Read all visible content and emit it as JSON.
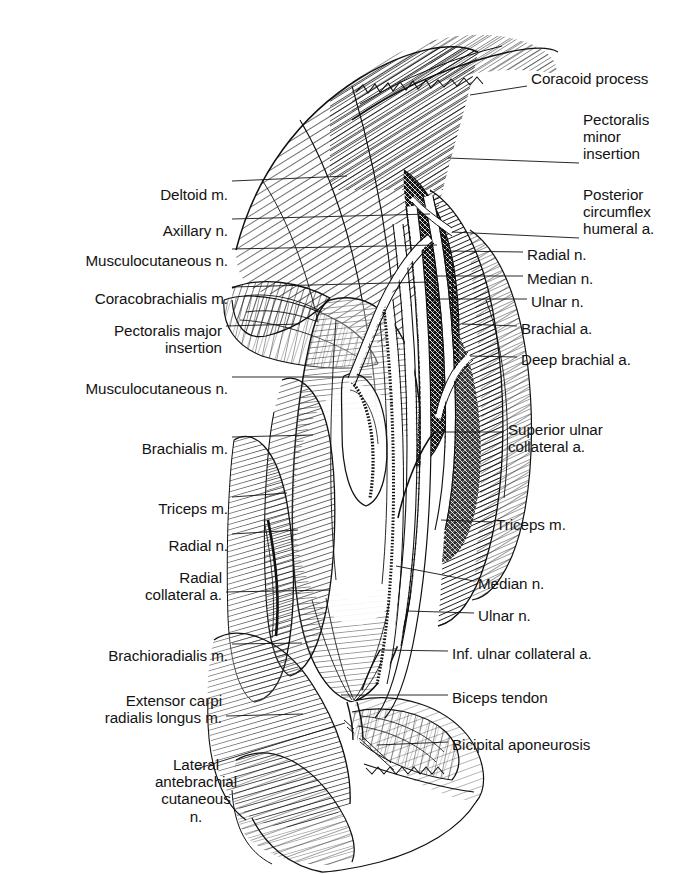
{
  "page": {
    "running_head": "THE ARM",
    "page_number": "123",
    "figure_title": "Anterior dissection of the right arm",
    "background_color": "#ffffff",
    "ink_color": "#111111",
    "style": "pen-and-ink line engraving"
  },
  "labels_left": [
    {
      "id": "deltoid",
      "text": "Deltoid m.",
      "x": 228,
      "y": 186,
      "align": "right",
      "leader": {
        "x1": 232,
        "y1": 181,
        "x2": 347,
        "y2": 176
      }
    },
    {
      "id": "axillary-n",
      "text": "Axillary n.",
      "x": 228,
      "y": 222,
      "align": "right",
      "leader": {
        "x1": 232,
        "y1": 219,
        "x2": 430,
        "y2": 214
      }
    },
    {
      "id": "musculocutaneous-1",
      "text": "Musculocutaneous n.",
      "x": 228,
      "y": 252,
      "align": "right",
      "leader": {
        "x1": 232,
        "y1": 249,
        "x2": 437,
        "y2": 245
      }
    },
    {
      "id": "coracobrachialis",
      "text": "Coracobrachialis m.",
      "x": 228,
      "y": 290,
      "align": "right",
      "leader": {
        "x1": 232,
        "y1": 287,
        "x2": 430,
        "y2": 282
      }
    },
    {
      "id": "pec-major",
      "text": "Pectoralis major\ninsertion",
      "x": 222,
      "y": 322,
      "align": "right",
      "leader": {
        "x1": 226,
        "y1": 326,
        "x2": 300,
        "y2": 324
      }
    },
    {
      "id": "musculocutaneous-2",
      "text": "Musculocutaneous n.",
      "x": 228,
      "y": 380,
      "align": "right",
      "leader": {
        "x1": 232,
        "y1": 377,
        "x2": 372,
        "y2": 377
      }
    },
    {
      "id": "brachialis",
      "text": "Brachialis m.",
      "x": 228,
      "y": 440,
      "align": "right",
      "leader": {
        "x1": 232,
        "y1": 437,
        "x2": 313,
        "y2": 435
      }
    },
    {
      "id": "triceps-left",
      "text": "Triceps m.",
      "x": 228,
      "y": 500,
      "align": "right",
      "leader": {
        "x1": 232,
        "y1": 497,
        "x2": 287,
        "y2": 493
      }
    },
    {
      "id": "radial-n-left",
      "text": "Radial n.",
      "x": 228,
      "y": 537,
      "align": "right",
      "leader": {
        "x1": 232,
        "y1": 534,
        "x2": 298,
        "y2": 530
      }
    },
    {
      "id": "radial-collateral",
      "text": "Radial\ncollateral a.",
      "x": 222,
      "y": 569,
      "align": "right",
      "leader": {
        "x1": 226,
        "y1": 592,
        "x2": 330,
        "y2": 590
      }
    },
    {
      "id": "brachioradialis",
      "text": "Brachioradialis m.",
      "x": 228,
      "y": 647,
      "align": "right",
      "leader": {
        "x1": 232,
        "y1": 644,
        "x2": 302,
        "y2": 643
      }
    },
    {
      "id": "ecrl",
      "text": "Extensor carpi\nradialis longus m.",
      "x": 222,
      "y": 692,
      "align": "right",
      "leader": {
        "x1": 226,
        "y1": 716,
        "x2": 303,
        "y2": 714
      }
    },
    {
      "id": "lacn",
      "text": "Lateral\nantebrachial\ncutaneous\nn.",
      "x": 196,
      "y": 756,
      "align": "center",
      "leader": {
        "x1": 196,
        "y1": 769,
        "x2": 345,
        "y2": 723
      }
    }
  ],
  "labels_right": [
    {
      "id": "coracoid",
      "text": "Coracoid process",
      "x": 531,
      "y": 70,
      "align": "left",
      "leader": {
        "x1": 527,
        "y1": 86,
        "x2": 470,
        "y2": 95
      }
    },
    {
      "id": "pec-minor",
      "text": "Pectoralis\nminor\ninsertion",
      "x": 583,
      "y": 111,
      "align": "left",
      "leader": {
        "x1": 579,
        "y1": 163,
        "x2": 448,
        "y2": 158
      }
    },
    {
      "id": "pcha",
      "text": "Posterior\ncircumflex\nhumeral a.",
      "x": 583,
      "y": 186,
      "align": "left",
      "leader": {
        "x1": 579,
        "y1": 238,
        "x2": 452,
        "y2": 232
      }
    },
    {
      "id": "radial-n-right",
      "text": "Radial n.",
      "x": 527,
      "y": 246,
      "align": "left",
      "leader": {
        "x1": 523,
        "y1": 252,
        "x2": 448,
        "y2": 251
      }
    },
    {
      "id": "median-n-right",
      "text": "Median n.",
      "x": 527,
      "y": 270,
      "align": "left",
      "leader": {
        "x1": 523,
        "y1": 276,
        "x2": 437,
        "y2": 276
      }
    },
    {
      "id": "ulnar-n-right",
      "text": "Ulnar n.",
      "x": 531,
      "y": 293,
      "align": "left",
      "leader": {
        "x1": 527,
        "y1": 299,
        "x2": 430,
        "y2": 299
      }
    },
    {
      "id": "brachial-a",
      "text": "Brachial a.",
      "x": 521,
      "y": 320,
      "align": "left",
      "leader": {
        "x1": 517,
        "y1": 326,
        "x2": 462,
        "y2": 324
      }
    },
    {
      "id": "deep-brachial-a",
      "text": "Deep brachial a.",
      "x": 521,
      "y": 351,
      "align": "left",
      "leader": {
        "x1": 517,
        "y1": 357,
        "x2": 470,
        "y2": 356
      }
    },
    {
      "id": "superior-ulnar",
      "text": "Superior ulnar\ncollateral a.",
      "x": 508,
      "y": 421,
      "align": "left",
      "leader": {
        "x1": 504,
        "y1": 432,
        "x2": 434,
        "y2": 432
      }
    },
    {
      "id": "triceps-right",
      "text": "Triceps m.",
      "x": 496,
      "y": 516,
      "align": "left",
      "leader": {
        "x1": 492,
        "y1": 522,
        "x2": 441,
        "y2": 520
      }
    },
    {
      "id": "median-n-lower",
      "text": "Median n.",
      "x": 478,
      "y": 575,
      "align": "left",
      "leader": {
        "x1": 474,
        "y1": 581,
        "x2": 396,
        "y2": 566
      }
    },
    {
      "id": "ulnar-n-lower",
      "text": "Ulnar n.",
      "x": 478,
      "y": 607,
      "align": "left",
      "leader": {
        "x1": 474,
        "y1": 613,
        "x2": 407,
        "y2": 611
      }
    },
    {
      "id": "inf-ulnar",
      "text": "Inf. ulnar collateral a.",
      "x": 452,
      "y": 645,
      "align": "left",
      "leader": {
        "x1": 448,
        "y1": 651,
        "x2": 380,
        "y2": 650
      }
    },
    {
      "id": "biceps-tendon",
      "text": "Biceps tendon",
      "x": 452,
      "y": 689,
      "align": "left",
      "leader": {
        "x1": 448,
        "y1": 695,
        "x2": 341,
        "y2": 695
      }
    },
    {
      "id": "bicipital-apo",
      "text": "Bicipital aponeurosis",
      "x": 452,
      "y": 736,
      "align": "left",
      "leader": {
        "x1": 448,
        "y1": 742,
        "x2": 377,
        "y2": 745
      }
    }
  ]
}
